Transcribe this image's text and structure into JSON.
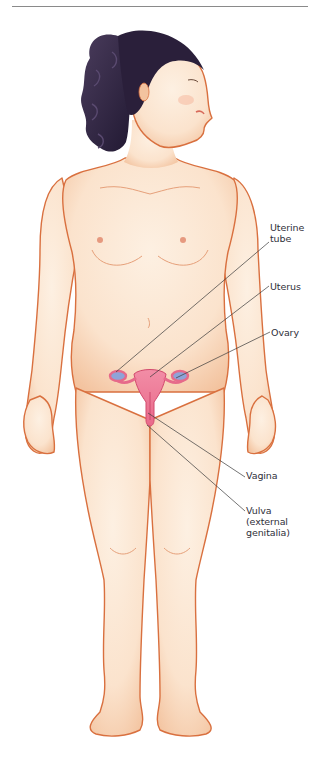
{
  "figure": {
    "colors": {
      "skin_fill": "#fbe3cd",
      "skin_shade": "#f3c39f",
      "skin_outline": "#d9703f",
      "hair": "#2a1f3a",
      "hair_highlight": "#4a3c5c",
      "organ_fill": "#ef7f9a",
      "organ_outline": "#d24a6d",
      "ovary_fill": "#8fa3d8",
      "leader_line": "#3a3a3a",
      "label_text": "#2f2f3a",
      "rule": "#8a8a8a"
    }
  },
  "labels": [
    {
      "id": "uterine-tube",
      "text": "Uterine\ntube",
      "x": 270,
      "y": 222,
      "line": {
        "x1": 269,
        "y1": 242,
        "x2": 116,
        "y2": 372
      }
    },
    {
      "id": "uterus",
      "text": "Uterus",
      "x": 270,
      "y": 281,
      "line": {
        "x1": 269,
        "y1": 286,
        "x2": 150,
        "y2": 377
      }
    },
    {
      "id": "ovary",
      "text": "Ovary",
      "x": 271,
      "y": 327,
      "line": {
        "x1": 270,
        "y1": 332,
        "x2": 176,
        "y2": 378
      }
    },
    {
      "id": "vagina",
      "text": "Vagina",
      "x": 246,
      "y": 470,
      "line": {
        "x1": 245,
        "y1": 477,
        "x2": 148,
        "y2": 413
      }
    },
    {
      "id": "vulva",
      "text": "Vulva\n(external\ngenitalia)",
      "x": 246,
      "y": 505,
      "line": {
        "x1": 245,
        "y1": 511,
        "x2": 147,
        "y2": 425
      }
    }
  ]
}
